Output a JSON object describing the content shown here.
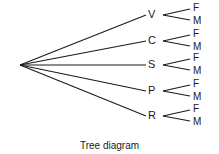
{
  "diagram": {
    "caption": "Tree diagram",
    "root": {
      "x": 20,
      "y": 65
    },
    "branches": [
      {
        "label": "V",
        "y": 15,
        "leaves": [
          "F",
          "M"
        ]
      },
      {
        "label": "C",
        "y": 41,
        "leaves": [
          "F",
          "M"
        ]
      },
      {
        "label": "S",
        "y": 65,
        "leaves": [
          "F",
          "M"
        ]
      },
      {
        "label": "P",
        "y": 91,
        "leaves": [
          "F",
          "M"
        ]
      },
      {
        "label": "R",
        "y": 116,
        "leaves": [
          "F",
          "M"
        ]
      }
    ],
    "line_color": "#1a1a1a"
  }
}
